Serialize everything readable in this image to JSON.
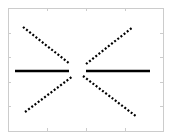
{
  "chart_data": {
    "type": "line",
    "title": "",
    "xlabel": "",
    "ylabel": "",
    "grid": false,
    "legend": null,
    "frame": {
      "x0": 8,
      "y0": 8,
      "x1": 163,
      "y1": 131,
      "color": "#cccccc"
    },
    "ticks": {
      "bottom": [
        8,
        47,
        86,
        125,
        163
      ],
      "left": [
        8,
        33,
        57,
        82,
        106,
        131
      ],
      "color": "#cccccc"
    },
    "series": [
      {
        "name": "upper-left-diagonal",
        "style": "dotted",
        "color": "#000000",
        "points": [
          [
            23,
            27
          ],
          [
            70,
            64
          ]
        ]
      },
      {
        "name": "upper-right-diagonal",
        "style": "dotted",
        "color": "#000000",
        "points": [
          [
            86,
            64
          ],
          [
            133,
            27
          ]
        ]
      },
      {
        "name": "left-horizontal",
        "style": "solid",
        "color": "#000000",
        "points": [
          [
            15,
            71
          ],
          [
            69,
            71
          ]
        ]
      },
      {
        "name": "right-horizontal",
        "style": "solid",
        "color": "#000000",
        "points": [
          [
            86,
            71
          ],
          [
            150,
            71
          ]
        ]
      },
      {
        "name": "lower-left-diagonal",
        "style": "dotted",
        "color": "#000000",
        "points": [
          [
            25,
            112
          ],
          [
            73,
            76
          ]
        ]
      },
      {
        "name": "lower-right-diagonal",
        "style": "dotted",
        "color": "#000000",
        "points": [
          [
            83,
            76
          ],
          [
            137,
            117
          ]
        ]
      }
    ]
  }
}
